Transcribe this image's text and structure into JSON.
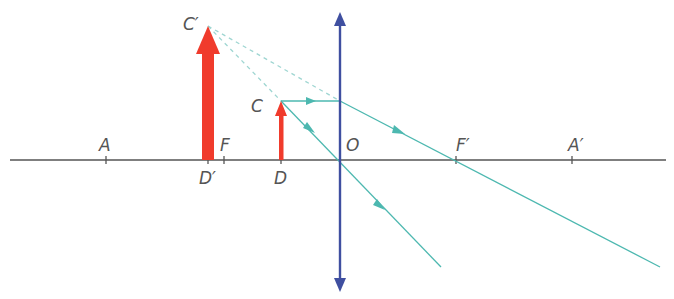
{
  "diagram": {
    "colors": {
      "axis": "#555555",
      "lens": "#3f4fa0",
      "object": "#f03b2c",
      "ray": "#4db8b0",
      "extension": "#9fd6d2",
      "label": "#555555"
    },
    "points": {
      "A": {
        "label": "A",
        "x": 106
      },
      "D_prime": {
        "label": "D′",
        "x": 208
      },
      "F": {
        "label": "F",
        "x": 224
      },
      "D": {
        "label": "D",
        "x": 281
      },
      "O": {
        "label": "O",
        "x": 340
      },
      "F_prime": {
        "label": "F′",
        "x": 456
      },
      "A_prime": {
        "label": "A′",
        "x": 572
      },
      "C": {
        "label": "C"
      },
      "C_prime": {
        "label": "C′"
      }
    },
    "elements": [
      "optical-axis",
      "converging-lens",
      "object-arrow-DC",
      "virtual-image-arrow-D'C'",
      "ray-parallel-through-F'",
      "ray-through-optical-center",
      "dashed-virtual-extensions"
    ]
  }
}
